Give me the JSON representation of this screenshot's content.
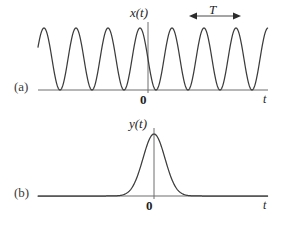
{
  "figure": {
    "background_color": "#ffffff",
    "stroke_color": "#4a4a4a",
    "curve_color": "#3c3c3c",
    "width": 285,
    "height": 229
  },
  "panels": [
    {
      "id": "panel-a",
      "label": "(a)",
      "signal_label": "x(t)",
      "origin_label": "0",
      "axis_label": "t",
      "period_label": "T"
    },
    {
      "id": "panel-b",
      "label": "(b)",
      "signal_label": "y(t)",
      "origin_label": "0",
      "axis_label": "t"
    }
  ],
  "chart_data": [
    {
      "type": "line",
      "name": "panel-a",
      "title": "x(t)",
      "xlabel": "t",
      "ylabel": "x(t)",
      "description": "Continuous sinusoidal (cosine) waveform with constant amplitude, peak aligned at t = 0",
      "waveform": "cosine",
      "amplitude": 1.0,
      "offset": 1.0,
      "period_px": 32,
      "period_symbol": "T",
      "peak_count": 7,
      "peaks_x_px": [
        44,
        76,
        108,
        140,
        172,
        204,
        236
      ],
      "baseline_y_px": 90,
      "peak_y_px": 28,
      "axis_x0_px": 38,
      "axis_x1_px": 268,
      "vertical_axis_x_px": 148,
      "vertical_axis_top_px": 22,
      "grid": false,
      "legend": "none",
      "annotations": [
        {
          "text": "T",
          "type": "double-arrow-span",
          "x_start_px": 190,
          "x_end_px": 240,
          "y_px": 16
        }
      ]
    },
    {
      "type": "line",
      "name": "panel-b",
      "title": "y(t)",
      "xlabel": "t",
      "ylabel": "y(t)",
      "description": "Single Gaussian-shaped pulse centered at t = 0, zero elsewhere",
      "waveform": "gaussian-pulse",
      "amplitude": 1.0,
      "center_x_px": 154,
      "sigma_px": 11,
      "peak_y_px": 134,
      "baseline_y_px": 196,
      "axis_x0_px": 38,
      "axis_x1_px": 268,
      "vertical_axis_x_px": 154,
      "vertical_axis_top_px": 128,
      "grid": false,
      "legend": "none"
    }
  ]
}
